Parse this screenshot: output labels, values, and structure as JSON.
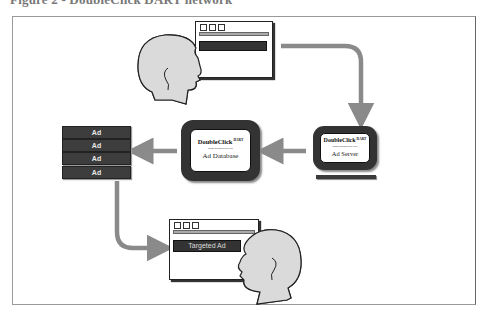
{
  "title": "Figure 2 - DoubleClick DART network",
  "diagram": {
    "nodes": {
      "user_top": {
        "label": "User browsing web page"
      },
      "ad_server": {
        "logo": "DoubleClick",
        "logo_sup": "DART",
        "url": "www.doubleclick.net",
        "label": "Ad Server"
      },
      "ad_database": {
        "logo": "DoubleClick",
        "logo_sup": "DART",
        "url": "www.doubleclick.net",
        "label": "Ad Database"
      },
      "ad_list": {
        "items": [
          "Ad",
          "Ad",
          "Ad",
          "Ad"
        ]
      },
      "user_bottom": {
        "targeted_ad_label": "Targeted Ad"
      }
    },
    "edges": [
      {
        "from": "user_top",
        "to": "ad_server"
      },
      {
        "from": "ad_server",
        "to": "ad_database"
      },
      {
        "from": "ad_database",
        "to": "ad_list"
      },
      {
        "from": "ad_list",
        "to": "user_bottom"
      }
    ],
    "colors": {
      "arrow": "#8a8a8a",
      "box_dark": "#333333",
      "head_fill": "#d9d9d9",
      "frame": "#9a9a9a"
    }
  }
}
